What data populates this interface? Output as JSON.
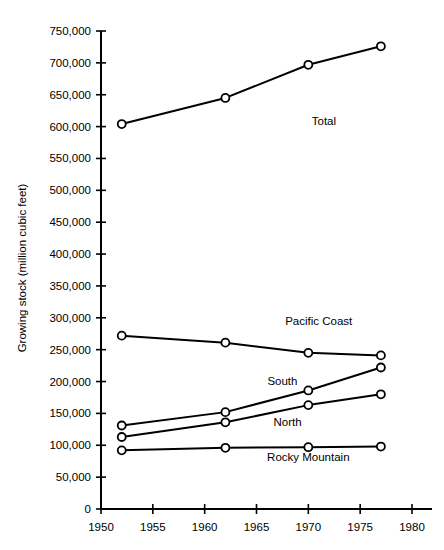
{
  "chart_data": {
    "type": "line",
    "title": "",
    "xlabel": "",
    "ylabel": "Growing stock (million cubic feet)",
    "x": [
      1952,
      1962,
      1970,
      1977
    ],
    "xlim": [
      1950,
      1980
    ],
    "ylim": [
      0,
      750000
    ],
    "grid": false,
    "legend_position": "inline-annotations",
    "xticks": [
      1950,
      1955,
      1960,
      1965,
      1970,
      1975,
      1980
    ],
    "xtick_labels": [
      "1950",
      "1955",
      "1960",
      "1965",
      "1970",
      "1975",
      "1980"
    ],
    "yticks": [
      0,
      50000,
      100000,
      150000,
      200000,
      250000,
      300000,
      350000,
      400000,
      450000,
      500000,
      550000,
      600000,
      650000,
      700000,
      750000
    ],
    "ytick_labels": [
      "0",
      "50,000",
      "100,000",
      "150,000",
      "200,000",
      "250,000",
      "300,000",
      "350,000",
      "400,000",
      "450,000",
      "500,000",
      "550,000",
      "600,000",
      "650,000",
      "700,000",
      "750,000"
    ],
    "series": [
      {
        "name": "Total",
        "label": "Total",
        "label_x": 1971.5,
        "label_y": 602000,
        "color": "#000000",
        "values": [
          604000,
          645000,
          697000,
          726000
        ]
      },
      {
        "name": "Pacific Coast",
        "label": "Pacific Coast",
        "label_x": 1971.0,
        "label_y": 288000,
        "color": "#000000",
        "values": [
          272000,
          261000,
          245000,
          241000
        ]
      },
      {
        "name": "South",
        "label": "South",
        "label_x": 1967.5,
        "label_y": 194000,
        "color": "#000000",
        "values": [
          131000,
          152000,
          186000,
          222000
        ]
      },
      {
        "name": "North",
        "label": "North",
        "label_x": 1968.0,
        "label_y": 131000,
        "color": "#000000",
        "values": [
          113000,
          136000,
          163000,
          180000
        ]
      },
      {
        "name": "Rocky Mountain",
        "label": "Rocky Mountain",
        "label_x": 1970.0,
        "label_y": 76000,
        "color": "#000000",
        "values": [
          92000,
          96000,
          97000,
          98000
        ]
      }
    ]
  }
}
